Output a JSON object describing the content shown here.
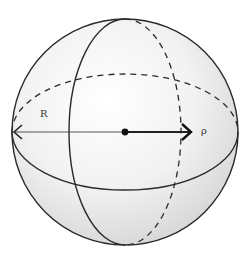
{
  "diagram": {
    "labels": {
      "radius_left": "R",
      "radius_right": "ρ"
    },
    "colors": {
      "outline": "#2a2a2a",
      "fill_light": "#ffffff",
      "fill_dark": "#d4d4d4",
      "center_dot": "#111111"
    }
  }
}
